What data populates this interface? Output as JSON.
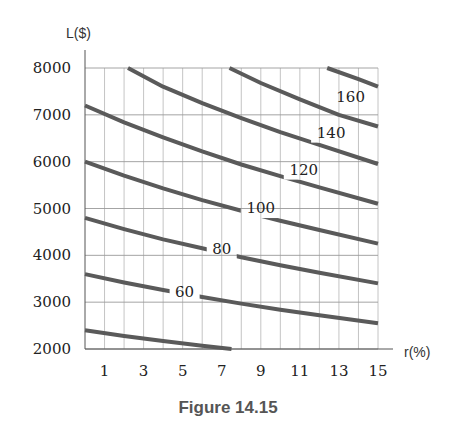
{
  "caption": "Figure 14.15",
  "chart_data": {
    "type": "line",
    "title": "",
    "xlabel": "r(%)",
    "ylabel": "L($)",
    "xlim": [
      0,
      15
    ],
    "ylim": [
      2000,
      8000
    ],
    "x_ticks": [
      1,
      3,
      5,
      7,
      9,
      11,
      13,
      15
    ],
    "y_ticks": [
      2000,
      3000,
      4000,
      5000,
      6000,
      7000,
      8000
    ],
    "grid": true,
    "series": [
      {
        "name": "40",
        "label": "",
        "x": [
          0,
          2,
          4,
          6,
          7.5
        ],
        "y": [
          2400,
          2280,
          2170,
          2070,
          2000
        ]
      },
      {
        "name": "60",
        "label": "60",
        "label_at": [
          5.1,
          3220
        ],
        "x": [
          0,
          2,
          4,
          6,
          8,
          10,
          12,
          15
        ],
        "y": [
          3600,
          3420,
          3260,
          3110,
          2970,
          2840,
          2720,
          2550
        ]
      },
      {
        "name": "80",
        "label": "80",
        "label_at": [
          7.0,
          4130
        ],
        "x": [
          0,
          2,
          4,
          6,
          8,
          10,
          12,
          15
        ],
        "y": [
          4800,
          4560,
          4340,
          4150,
          3960,
          3790,
          3630,
          3400
        ]
      },
      {
        "name": "100",
        "label": "100",
        "label_at": [
          9.0,
          5010
        ],
        "x": [
          0,
          2,
          4,
          6,
          8,
          10,
          12,
          15
        ],
        "y": [
          6000,
          5700,
          5430,
          5180,
          4950,
          4740,
          4540,
          4250
        ]
      },
      {
        "name": "120",
        "label": "120",
        "label_at": [
          11.2,
          5830
        ],
        "x": [
          0,
          2,
          4,
          6,
          8,
          10,
          12,
          15
        ],
        "y": [
          7200,
          6840,
          6520,
          6220,
          5940,
          5690,
          5450,
          5100
        ]
      },
      {
        "name": "140",
        "label": "140",
        "label_at": [
          12.6,
          6620
        ],
        "x": [
          2.2,
          4,
          6,
          8,
          10,
          12,
          15
        ],
        "y": [
          8000,
          7600,
          7250,
          6930,
          6630,
          6360,
          5950
        ]
      },
      {
        "name": "160",
        "label": "160",
        "label_at": [
          13.6,
          7390
        ],
        "x": [
          7.4,
          9,
          11,
          13,
          15
        ],
        "y": [
          8000,
          7680,
          7330,
          7000,
          6750
        ]
      },
      {
        "name": "180",
        "label": "",
        "x": [
          12.4,
          14,
          15
        ],
        "y": [
          8000,
          7760,
          7600
        ]
      }
    ]
  }
}
